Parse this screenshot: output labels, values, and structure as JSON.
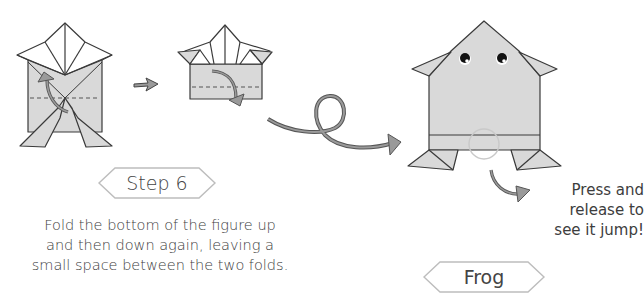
{
  "step": {
    "label": "Step 6",
    "instruction_lines": [
      "Fold the bottom of the figure up",
      "and then down again, leaving a",
      "small space between the two folds."
    ]
  },
  "result": {
    "label": "Frog",
    "note_lines": [
      "Press and",
      "release to",
      "see it jump!"
    ]
  },
  "diagrams": [
    {
      "name": "fold-up-diagram",
      "fold_line": "dashed",
      "arrow": "curved-up"
    },
    {
      "name": "fold-down-diagram",
      "fold_line": "dashed",
      "arrow": "curved-down"
    },
    {
      "name": "finished-frog",
      "feature": "press-point-circle"
    }
  ],
  "colors": {
    "paper_fill": "#d9d9d9",
    "paper_light": "#ffffff",
    "outline": "#3a3a3a",
    "arrow_fill": "#9a9a9a",
    "label_border": "#bdbdbd",
    "text": "#3d3d3d"
  }
}
